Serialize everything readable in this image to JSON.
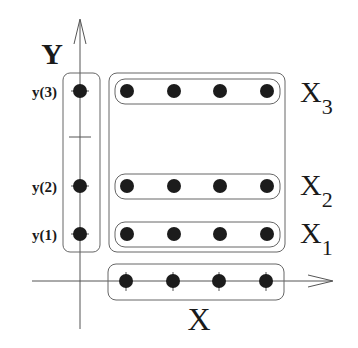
{
  "diagram": {
    "axes": {
      "x_label": "X",
      "y_label": "Y"
    },
    "y_ticks": [
      {
        "label": "y(3)",
        "y": 91
      },
      {
        "label": "y(2)",
        "y": 186
      },
      {
        "label": "y(1)",
        "y": 234
      }
    ],
    "row_groups": [
      {
        "label_main": "X",
        "label_sub": "3",
        "y": 91
      },
      {
        "label_main": "X",
        "label_sub": "2",
        "y": 186
      },
      {
        "label_main": "X",
        "label_sub": "1",
        "y": 234
      }
    ],
    "x_points_count": 4,
    "colors": {
      "ink": "#1a1a1a",
      "line": "#555555",
      "dot": "#1c1c1c",
      "background": "#ffffff"
    }
  }
}
